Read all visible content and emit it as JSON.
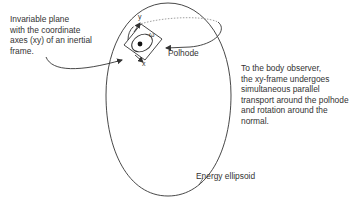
{
  "labels": {
    "invariable_plane": [
      "Invariable plane",
      "with the coordinate",
      "axes (xy) of an inertial",
      "frame."
    ],
    "polhode": "Polhode",
    "body_observer": [
      "To the body observer,",
      "the xy-frame undergoes",
      "simultaneous parallel",
      "transport around the polhode",
      "and rotation around the",
      "normal."
    ],
    "energy_ellipsoid": "Energy ellipsoid",
    "axis_x": "x",
    "axis_y": "y",
    "omega": "ω"
  },
  "colors": {
    "line": "#333333",
    "dotted": "#888888",
    "background": "#ffffff"
  }
}
